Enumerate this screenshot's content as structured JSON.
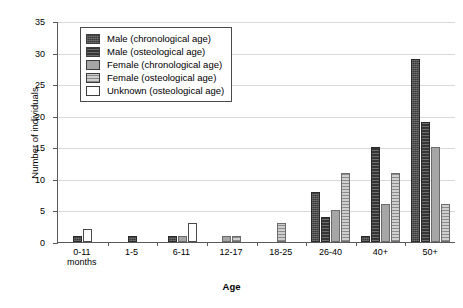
{
  "chart_data": {
    "type": "bar",
    "title": "",
    "xlabel": "Age",
    "ylabel": "Number of individuals",
    "ylim": [
      0,
      35
    ],
    "ytick_step": 5,
    "yticks": [
      0,
      5,
      10,
      15,
      20,
      25,
      30,
      35
    ],
    "grid": "horizontal",
    "legend_position": "upper-left-inside",
    "categories": [
      "0-11 months",
      "1-5",
      "6-11",
      "12-17",
      "18-25",
      "26-40",
      "40+",
      "50+"
    ],
    "series": [
      {
        "name": "Male (chronological age)",
        "swatch": "dark-textured",
        "color": "#3a3a3a",
        "values": [
          1,
          1,
          1,
          0,
          0,
          8,
          1,
          29
        ]
      },
      {
        "name": "Male (osteological age)",
        "swatch": "dark-striped",
        "color": "#3f3f3f",
        "values": [
          0,
          0,
          0,
          0,
          0,
          4,
          15,
          19
        ]
      },
      {
        "name": "Female (chronological age)",
        "swatch": "solid-gray",
        "color": "#a6a6a6",
        "values": [
          0,
          0,
          1,
          1,
          0,
          5,
          6,
          15
        ]
      },
      {
        "name": "Female (osteological age)",
        "swatch": "gray-striped",
        "color": "#c4c4c4",
        "values": [
          0,
          0,
          0,
          1,
          3,
          11,
          11,
          6
        ]
      },
      {
        "name": "Unknown (osteological age)",
        "swatch": "white",
        "color": "#ffffff",
        "values": [
          2,
          0,
          3,
          0,
          0,
          0,
          0,
          0
        ]
      }
    ]
  },
  "axes": {
    "y_title": "Number of individuals",
    "x_title": "Age"
  },
  "caption": ""
}
